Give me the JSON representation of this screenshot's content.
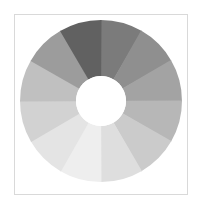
{
  "figure": {
    "background_color": "#ffffff",
    "frame_color": "#d9d9d9",
    "frame_label": "plot-frame"
  },
  "chart_data": {
    "type": "pie",
    "variant": "donut",
    "title": "",
    "subtitle": "",
    "xlabel": "",
    "ylabel": "",
    "legend": "none",
    "grid": false,
    "labels_visible": false,
    "center_x": 101,
    "center_y": 101,
    "outer_radius": 81,
    "inner_radius": 25,
    "hole_color": "#ffffff",
    "start_angle_deg": -90,
    "direction": "clockwise",
    "segment_count": 12,
    "categories": [
      "Segment 1",
      "Segment 2",
      "Segment 3",
      "Segment 4",
      "Segment 5",
      "Segment 6",
      "Segment 7",
      "Segment 8",
      "Segment 9",
      "Segment 10",
      "Segment 11",
      "Segment 12"
    ],
    "values": [
      8.333,
      8.333,
      8.333,
      8.333,
      8.333,
      8.333,
      8.333,
      8.333,
      8.333,
      8.333,
      8.333,
      8.333
    ],
    "sweep_degrees": [
      30,
      30,
      30,
      30,
      30,
      30,
      30,
      30,
      30,
      30,
      30,
      30
    ],
    "colors": [
      "#7b7b7b",
      "#8f8f8f",
      "#a3a3a3",
      "#b7b7b7",
      "#cbcbcb",
      "#dedede",
      "#eeeeee",
      "#e4e4e4",
      "#d2d2d2",
      "#c0c0c0",
      "#9c9c9c",
      "#616161"
    ],
    "colormap": "grayscale-sequential"
  }
}
